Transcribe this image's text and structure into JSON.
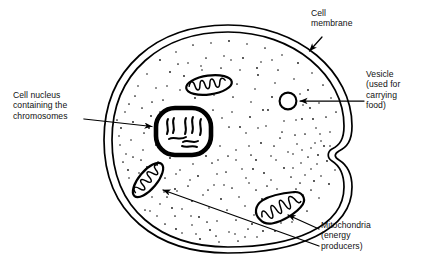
{
  "diagram": {
    "type": "biology-cell-diagram",
    "background_color": "#ffffff",
    "line_color": "#000000"
  },
  "labels": {
    "cell_membrane": "Cell\nmembrane",
    "vesicle": "Vesicle\n(used for\ncarrying\nfood)",
    "nucleus": "Cell nucleus\ncontaining the\nchromosomes",
    "mitochondria": "Mitochondria\n(energy\nproducers)"
  },
  "structures": [
    {
      "name": "cell-membrane",
      "label": "Cell membrane",
      "shape": "double-line oval with invagination on right side",
      "center": [
        228,
        139
      ],
      "radius_x": 120,
      "radius_y": 111
    },
    {
      "name": "cytoplasm",
      "label": "Cytoplasm (stippled)",
      "shape": "stipple dot fill inside membrane"
    },
    {
      "name": "cell-nucleus",
      "label": "Cell nucleus containing the chromosomes",
      "shape": "thick-walled rounded oval with chromosomes",
      "center": [
        183,
        131
      ],
      "width": 56,
      "height": 48,
      "chromosome_count": 6
    },
    {
      "name": "vesicle",
      "label": "Vesicle (used for carrying food)",
      "shape": "small circle",
      "center": [
        288,
        101
      ],
      "diameter": 17
    },
    {
      "name": "mitochondrion-top",
      "label": "Mitochondria (energy producers)",
      "shape": "ellipse with cristae",
      "center": [
        209,
        85
      ],
      "rotation_deg": -8
    },
    {
      "name": "mitochondrion-left",
      "label": "Mitochondria (energy producers)",
      "shape": "bean with cristae",
      "center": [
        148,
        180
      ],
      "rotation_deg": -52
    },
    {
      "name": "mitochondrion-bottom-right",
      "label": "Mitochondria (energy producers)",
      "shape": "curved bean with cristae",
      "center": [
        280,
        206
      ],
      "rotation_deg": -28
    }
  ],
  "leader_lines": [
    {
      "name": "membrane-arrow",
      "from": [
        322,
        38
      ],
      "to": [
        308,
        52
      ]
    },
    {
      "name": "vesicle-arrow",
      "from": [
        363,
        101
      ],
      "to": [
        300,
        101
      ]
    },
    {
      "name": "nucleus-arrow",
      "from": [
        85,
        120
      ],
      "to": [
        153,
        127
      ]
    },
    {
      "name": "mitochondria-arrow-left",
      "from": [
        318,
        245
      ],
      "to": [
        161,
        189
      ]
    },
    {
      "name": "mitochondria-arrow-right",
      "from": [
        318,
        228
      ],
      "to": [
        286,
        214
      ]
    }
  ]
}
